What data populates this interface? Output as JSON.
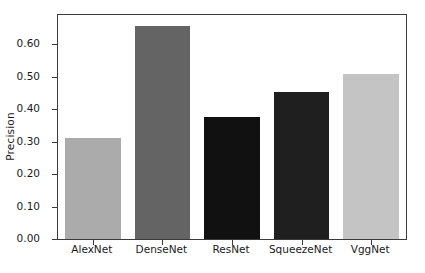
{
  "chart_data": {
    "type": "bar",
    "title": "",
    "xlabel": "",
    "ylabel": "Precision",
    "categories": [
      "AlexNet",
      "DenseNet",
      "ResNet",
      "SqueezeNet",
      "VggNet"
    ],
    "values": [
      0.31,
      0.655,
      0.377,
      0.453,
      0.508
    ],
    "bar_colors": [
      "#ababab",
      "#646464",
      "#111111",
      "#1f1f1f",
      "#c4c4c4"
    ],
    "ylim": [
      0.0,
      0.69
    ],
    "yticks": [
      0.0,
      0.1,
      0.2,
      0.3,
      0.4,
      0.5,
      0.6
    ],
    "ytick_labels": [
      "0.00",
      "0.10",
      "0.20",
      "0.30",
      "0.40",
      "0.50",
      "0.60"
    ],
    "grid": false,
    "legend": null,
    "legend_position": "none",
    "axis_color": "#3a3a3a",
    "text_color": "#1a1a1a",
    "background_color": "#ffffff"
  }
}
